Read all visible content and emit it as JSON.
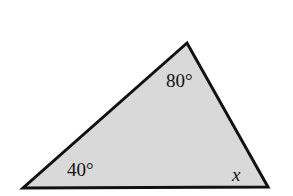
{
  "diagram": {
    "type": "triangle",
    "fill_color": "#d9d9d9",
    "stroke_color": "#111111",
    "vertices": {
      "top": [
        187,
        43
      ],
      "bottom_left": [
        23,
        188
      ],
      "bottom_right": [
        268,
        187
      ]
    },
    "angles": {
      "top": "80°",
      "bottom_left": "40°",
      "bottom_right": "x"
    }
  }
}
